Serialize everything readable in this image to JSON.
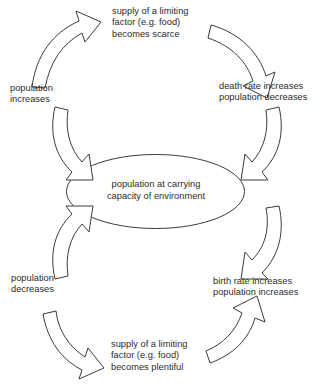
{
  "diagram": {
    "type": "cycle-diagram",
    "background_color": "#ffffff",
    "stroke_color": "#3a3a3a",
    "text_color": "#2b2b2b",
    "center": {
      "shape": "ellipse",
      "line1": "population at carrying",
      "line2": "capacity of environment"
    },
    "nodes": [
      {
        "id": "limiting-factor-scarce",
        "position": "top",
        "line1": "supply of a limiting",
        "line2": "factor (e.g. food)",
        "line3": "becomes scarce"
      },
      {
        "id": "death-rate-increases",
        "position": "right-top",
        "line1": "death rate increases",
        "line2": "population decreases"
      },
      {
        "id": "population-increases",
        "position": "left-top",
        "line1": "population",
        "line2": "increases"
      },
      {
        "id": "population-decreases",
        "position": "left-bottom",
        "line1": "population",
        "line2": "decreases"
      },
      {
        "id": "birth-rate-increases",
        "position": "right-bottom",
        "line1": "birth rate increases",
        "line2": "population increases"
      },
      {
        "id": "limiting-factor-plentiful",
        "position": "bottom",
        "line1": "supply of a limiting",
        "line2": "factor (e.g. food)",
        "line3": "becomes plentiful"
      }
    ],
    "arrows": [
      {
        "id": "arrow-top-left",
        "direction": "up-right",
        "from": "population-increases",
        "to": "limiting-factor-scarce"
      },
      {
        "id": "arrow-top-right",
        "direction": "down-right",
        "from": "limiting-factor-scarce",
        "to": "death-rate-increases"
      },
      {
        "id": "arrow-right-upper",
        "direction": "down-left",
        "from": "death-rate-increases",
        "to": "center"
      },
      {
        "id": "arrow-right-lower",
        "direction": "up-left",
        "from": "birth-rate-increases",
        "to": "center"
      },
      {
        "id": "arrow-left-upper",
        "direction": "up-left",
        "from": "center",
        "to": "population-increases"
      },
      {
        "id": "arrow-left-lower",
        "direction": "down-left",
        "from": "center",
        "to": "population-decreases"
      },
      {
        "id": "arrow-bottom-left",
        "direction": "down-right",
        "from": "population-decreases",
        "to": "limiting-factor-plentiful"
      },
      {
        "id": "arrow-bottom-right",
        "direction": "up-right",
        "from": "limiting-factor-plentiful",
        "to": "birth-rate-increases"
      }
    ]
  }
}
